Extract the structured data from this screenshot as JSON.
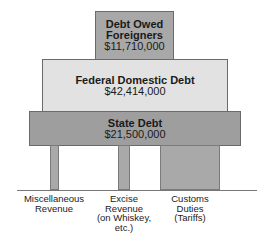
{
  "diagram": {
    "blocks": {
      "top": {
        "title_line1": "Debt Owed",
        "title_line2": "Foreigners",
        "amount": "$11,710,000",
        "color": "#a8a8a8"
      },
      "middle": {
        "title": "Federal Domestic Debt",
        "amount": "$42,414,000",
        "color": "#e2e2e2"
      },
      "base": {
        "title": "State Debt",
        "amount": "$21,500,000",
        "color": "#9e9e9e"
      }
    },
    "pillars": [
      {
        "label_lines": [
          "Miscellaneous",
          "Revenue"
        ]
      },
      {
        "label_lines": [
          "Excise",
          "Revenue",
          "(on Whiskey,",
          "etc.)"
        ]
      },
      {
        "label_lines": [
          "Customs",
          "Duties",
          "(Tariffs)"
        ]
      }
    ]
  }
}
